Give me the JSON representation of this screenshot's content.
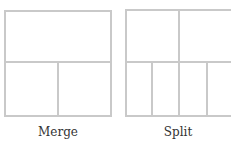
{
  "diagrams": [
    {
      "name": "merge",
      "label": "Merge"
    },
    {
      "name": "split",
      "label": "Split"
    }
  ],
  "colors": {
    "line": "#c9c9c9",
    "text": "#333333",
    "background": "#ffffff"
  }
}
